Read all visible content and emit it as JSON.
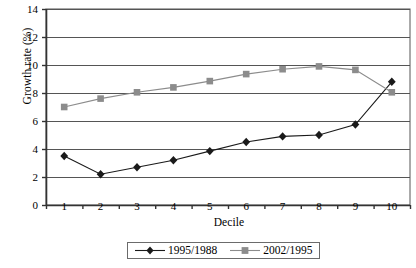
{
  "chart_data": {
    "type": "line",
    "title": "",
    "xlabel": "Decile",
    "ylabel": "Growth rate (%)",
    "categories": [
      "1",
      "2",
      "3",
      "4",
      "5",
      "6",
      "7",
      "8",
      "9",
      "10"
    ],
    "ylim": [
      0,
      14
    ],
    "yticks": [
      0,
      2,
      4,
      6,
      8,
      10,
      12,
      14
    ],
    "ytick_labels": [
      "0",
      "2",
      "4",
      "6",
      "8",
      "10",
      "12",
      "14"
    ],
    "grid": "horizontal",
    "legend_position": "bottom-center",
    "series": [
      {
        "name": "1995/1988",
        "marker": "diamond",
        "color": "#1a1a1a",
        "values": [
          3.5,
          2.2,
          2.7,
          3.2,
          3.85,
          4.5,
          4.9,
          5.0,
          5.75,
          8.8
        ]
      },
      {
        "name": "2002/1995",
        "marker": "square",
        "color": "#8c8c8c",
        "values": [
          7.0,
          7.6,
          8.05,
          8.4,
          8.85,
          9.35,
          9.7,
          9.9,
          9.65,
          8.05
        ]
      }
    ]
  },
  "legend": {
    "entries": [
      {
        "label": "1995/1988"
      },
      {
        "label": "2002/1995"
      }
    ]
  }
}
